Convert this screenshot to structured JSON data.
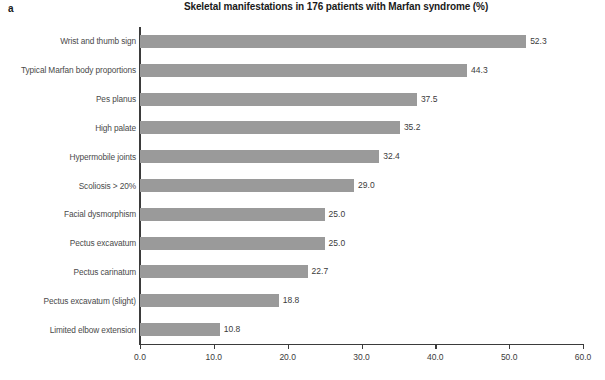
{
  "panel": {
    "letter": "a"
  },
  "chart_data": {
    "type": "bar",
    "orientation": "horizontal",
    "title": "Skeletal manifestations in 176 patients with Marfan syndrome (%)",
    "xlabel": "",
    "ylabel": "",
    "xlim": [
      0.0,
      60.0
    ],
    "grid": false,
    "legend": false,
    "bar_color": "#9a9a9a",
    "axis_color": "#3b3b3b",
    "xticks": [
      "0.0",
      "10.0",
      "20.0",
      "30.0",
      "40.0",
      "50.0",
      "60.0"
    ],
    "xtick_values": [
      0,
      10,
      20,
      30,
      40,
      50,
      60
    ],
    "categories": [
      "Wrist and thumb sign",
      "Typical Marfan body proportions",
      "Pes planus",
      "High palate",
      "Hypermobile joints",
      "Scoliosis > 20%",
      "Facial dysmorphism",
      "Pectus excavatum",
      "Pectus carinatum",
      "Pectus excavatum (slight)",
      "Limited elbow extension"
    ],
    "values": [
      52.3,
      44.3,
      37.5,
      35.2,
      32.4,
      29.0,
      25.0,
      25.0,
      22.7,
      18.8,
      10.8
    ],
    "value_labels": [
      "52.3",
      "44.3",
      "37.5",
      "35.2",
      "32.4",
      "29.0",
      "25.0",
      "25.0",
      "22.7",
      "18.8",
      "10.8"
    ]
  }
}
